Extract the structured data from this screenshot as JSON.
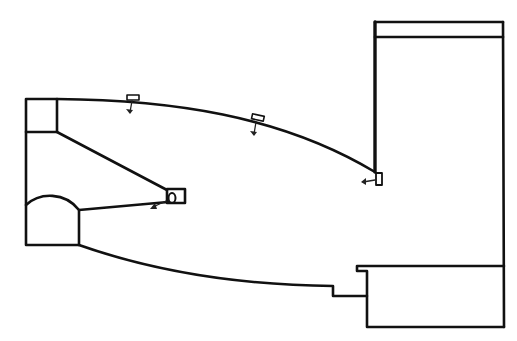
{
  "diagram": {
    "type": "line-drawing",
    "colors": {
      "background": "#ffffff",
      "stroke": "#111111"
    },
    "elements": [
      {
        "name": "top-left-box",
        "shape": "rectangle"
      },
      {
        "name": "arched-box",
        "shape": "arched-rectangle"
      },
      {
        "name": "right-tall-box",
        "shape": "rectangle-with-header-band"
      },
      {
        "name": "bottom-right-box",
        "shape": "rectangle-with-notch"
      },
      {
        "name": "upper-curved-wall",
        "shape": "curve"
      },
      {
        "name": "lower-curved-wall",
        "shape": "curve"
      },
      {
        "name": "diagonal-wall",
        "shape": "line"
      },
      {
        "name": "small-nozzle-box",
        "shape": "rectangle"
      }
    ],
    "markers": [
      {
        "name": "vent-1",
        "arrow": "down"
      },
      {
        "name": "vent-2",
        "arrow": "down"
      },
      {
        "name": "vent-3",
        "arrow": "left"
      },
      {
        "name": "nozzle-vent",
        "arrow": "down-left"
      }
    ],
    "text": []
  }
}
